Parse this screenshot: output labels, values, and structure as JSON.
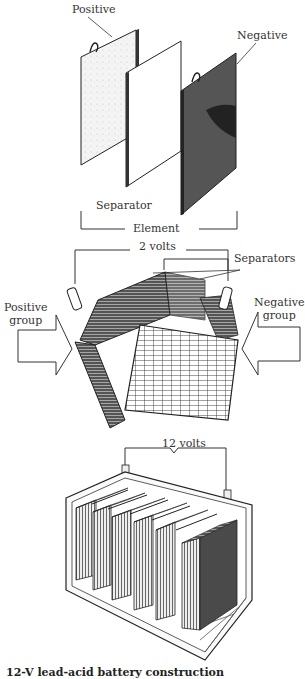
{
  "figure": {
    "panel_element": {
      "labels": {
        "positive": "Positive",
        "negative": "Negative",
        "separator": "Separator",
        "element": "Element"
      }
    },
    "panel_cell": {
      "labels": {
        "voltage": "2 volts",
        "separators": "Separators",
        "positive_group": "Positive\ngroup",
        "negative_group": "Negative\ngroup"
      }
    },
    "panel_battery": {
      "labels": {
        "voltage": "12 volts"
      },
      "cell_count": 6
    },
    "caption_partial": "12-V lead-acid battery construction"
  }
}
